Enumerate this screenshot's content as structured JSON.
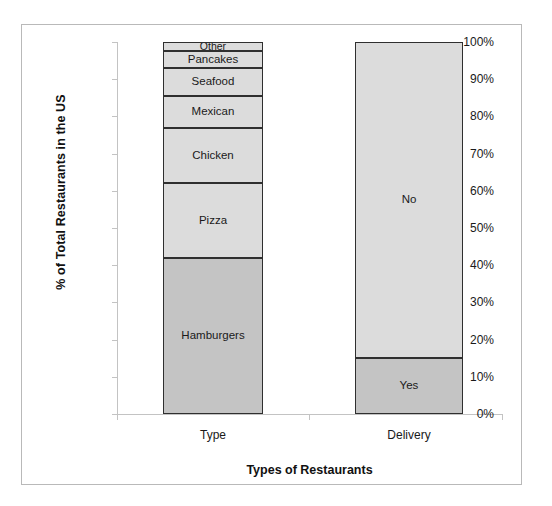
{
  "title": "",
  "frame": {
    "border_color": "#b9b9b9"
  },
  "axes": {
    "y_title": "% of Total Restaurants in the US",
    "x_title": "Types of Restaurants",
    "y_ticks": [
      "0%",
      "10%",
      "20%",
      "30%",
      "40%",
      "50%",
      "60%",
      "70%",
      "80%",
      "90%",
      "100%"
    ],
    "categories": [
      "Type",
      "Delivery"
    ]
  },
  "colors": {
    "fill_light": "#dcdcdc",
    "fill_dark": "#c4c4c4",
    "segment_border": "#2f2f2f",
    "axis_line": "#c3c3c3",
    "frame_border": "#b9b9b9",
    "text": "#1a1a1a"
  },
  "chart_data": {
    "type": "bar",
    "subtype": "stacked-100",
    "title": "",
    "xlabel": "Types of Restaurants",
    "ylabel": "% of Total Restaurants in the US",
    "ylim": [
      0,
      100
    ],
    "ytick_labels": [
      "0%",
      "10%",
      "20%",
      "30%",
      "40%",
      "50%",
      "60%",
      "70%",
      "80%",
      "90%",
      "100%"
    ],
    "ytick_values": [
      0,
      10,
      20,
      30,
      40,
      50,
      60,
      70,
      80,
      90,
      100
    ],
    "grid": false,
    "legend": "none (segments labeled in place)",
    "categories": [
      "Type",
      "Delivery"
    ],
    "bars": [
      {
        "category": "Type",
        "segments": [
          {
            "label": "Hamburgers",
            "value": 42,
            "start": 0,
            "end": 42,
            "fill": "#c4c4c4"
          },
          {
            "label": "Pizza",
            "value": 20,
            "start": 42,
            "end": 62,
            "fill": "#dcdcdc"
          },
          {
            "label": "Chicken",
            "value": 15,
            "start": 62,
            "end": 77,
            "fill": "#dcdcdc"
          },
          {
            "label": "Mexican",
            "value": 8.5,
            "start": 77,
            "end": 85.5,
            "fill": "#dcdcdc"
          },
          {
            "label": "Seafood",
            "value": 7.5,
            "start": 85.5,
            "end": 93,
            "fill": "#dcdcdc"
          },
          {
            "label": "Pancakes",
            "value": 4.5,
            "start": 93,
            "end": 97.5,
            "fill": "#dcdcdc"
          },
          {
            "label": "Other",
            "value": 2.5,
            "start": 97.5,
            "end": 100,
            "fill": "#dcdcdc"
          }
        ]
      },
      {
        "category": "Delivery",
        "segments": [
          {
            "label": "Yes",
            "value": 15,
            "start": 0,
            "end": 15,
            "fill": "#c4c4c4"
          },
          {
            "label": "No",
            "value": 85,
            "start": 15,
            "end": 100,
            "fill": "#dcdcdc"
          }
        ]
      }
    ]
  }
}
